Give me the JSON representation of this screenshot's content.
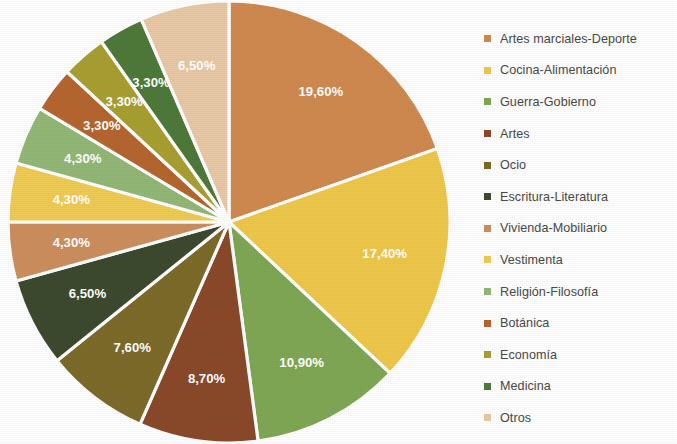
{
  "chart_data": {
    "type": "pie",
    "title": "",
    "subtitle": "",
    "xlabel": "",
    "ylabel": "",
    "legend_position": "right",
    "grid": false,
    "value_suffix": "%",
    "decimal_separator": ",",
    "start_angle_deg": 0,
    "direction": "clockwise",
    "categories": [
      "Artes marciales-Deporte",
      "Cocina-Alimentación",
      "Guerra-Gobierno",
      "Artes",
      "Ocio",
      "Escritura-Literatura",
      "Vivienda-Mobiliario",
      "Vestimenta",
      "Religión-Filosofía",
      "Botánica",
      "Economía",
      "Medicina",
      "Otros"
    ],
    "values": [
      19.6,
      17.4,
      10.9,
      8.7,
      7.6,
      6.5,
      4.3,
      4.3,
      4.3,
      3.3,
      3.3,
      3.3,
      6.5
    ],
    "data_labels": [
      "19,60%",
      "17,40%",
      "10,90%",
      "8,70%",
      "7,60%",
      "6,50%",
      "4,30%",
      "4,30%",
      "4,30%",
      "3,30%",
      "3,30%",
      "3,30%",
      "6,50%"
    ],
    "colors": [
      "#d08a50",
      "#efc84b",
      "#7fa855",
      "#8a4a2a",
      "#7d6b2a",
      "#3e4a2e",
      "#cc8f5e",
      "#f0cc55",
      "#93b877",
      "#b5662e",
      "#a8a032",
      "#4e7a3a",
      "#e8c9a8"
    ],
    "label_color": "#ffffff",
    "slice_border_color": "#ffffff",
    "background_color": "#ffffff"
  },
  "legend": {
    "items": [
      {
        "label": "Artes marciales-Deporte",
        "color": "#d08a50"
      },
      {
        "label": "Cocina-Alimentación",
        "color": "#efc84b"
      },
      {
        "label": "Guerra-Gobierno",
        "color": "#7fa855"
      },
      {
        "label": "Artes",
        "color": "#8a4a2a"
      },
      {
        "label": "Ocio",
        "color": "#7d6b2a"
      },
      {
        "label": "Escritura-Literatura",
        "color": "#3e4a2e"
      },
      {
        "label": "Vivienda-Mobiliario",
        "color": "#cc8f5e"
      },
      {
        "label": "Vestimenta",
        "color": "#f0cc55"
      },
      {
        "label": "Religión-Filosofía",
        "color": "#93b877"
      },
      {
        "label": "Botánica",
        "color": "#b5662e"
      },
      {
        "label": "Economía",
        "color": "#a8a032"
      },
      {
        "label": "Medicina",
        "color": "#4e7a3a"
      },
      {
        "label": "Otros",
        "color": "#e8c9a8"
      }
    ]
  },
  "geometry": {
    "center_x": 229,
    "center_y": 222,
    "radius": 221,
    "label_radius_fraction": 0.72
  }
}
